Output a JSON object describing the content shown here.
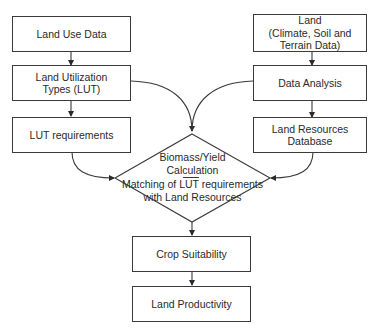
{
  "diagram": {
    "left_column": [
      {
        "id": "land-use-data",
        "lines": [
          "Land Use Data"
        ]
      },
      {
        "id": "land-utilization-types",
        "lines": [
          "Land Utilization",
          "Types (LUT)"
        ]
      },
      {
        "id": "lut-requirements",
        "lines": [
          "LUT requirements"
        ]
      }
    ],
    "right_column": [
      {
        "id": "land",
        "lines": [
          "Land",
          "(Climate, Soil and",
          "Terrain Data)"
        ]
      },
      {
        "id": "data-analysis",
        "lines": [
          "Data Analysis"
        ]
      },
      {
        "id": "land-resources-database",
        "lines": [
          "Land Resources",
          "Database"
        ]
      }
    ],
    "decision": {
      "line1": "Biomass/Yield",
      "line2": "Calculation",
      "line3": "Matching of LUT requirements",
      "line4": "with Land Resources"
    },
    "bottom_column": [
      {
        "id": "crop-suitability",
        "lines": [
          "Crop Suitability"
        ]
      },
      {
        "id": "land-productivity",
        "lines": [
          "Land Productivity"
        ]
      }
    ],
    "colors": {
      "stroke": "#3a3a3a",
      "background": "#ffffff",
      "text": "#2a2a2a"
    }
  }
}
